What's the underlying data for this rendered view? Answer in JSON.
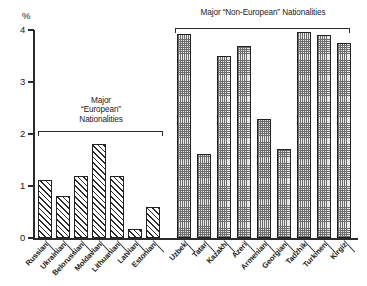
{
  "chart_data": {
    "type": "bar",
    "title": "",
    "xlabel": "",
    "ylabel": "%",
    "ylim": [
      0,
      4
    ],
    "ytick_labels": [
      "4",
      "3",
      "2",
      "1",
      "0"
    ],
    "ytick_values": [
      4,
      3,
      2,
      1,
      0
    ],
    "grid": false,
    "legend": null,
    "categories": [
      "Russian",
      "Ukrainian",
      "Belorussian",
      "Moldavian",
      "Lithuanian",
      "Latvian",
      "Estonian",
      "Uzbek",
      "Tatar",
      "Kazakh",
      "Azeri",
      "Armenian",
      "Georgian",
      "Tadzhik",
      "Turkmen",
      "Kirgiz"
    ],
    "values": [
      1.12,
      0.8,
      1.19,
      1.8,
      1.19,
      0.18,
      0.6,
      3.92,
      1.62,
      3.5,
      3.7,
      2.28,
      1.71,
      3.97,
      3.9,
      3.75
    ],
    "groups": [
      {
        "id": "european",
        "label_lines": [
          "Major",
          "“European”",
          "Nationalities"
        ],
        "pattern": "diagonal-hatch",
        "categories": [
          "Russian",
          "Ukrainian",
          "Belorussian",
          "Moldavian",
          "Lithuanian",
          "Latvian",
          "Estonian"
        ]
      },
      {
        "id": "non-european",
        "label_lines": [
          "Major “Non-European” Nationalities"
        ],
        "pattern": "checkered-dots",
        "categories": [
          "Uzbek",
          "Tatar",
          "Kazakh",
          "Azeri",
          "Armenian",
          "Georgian",
          "Tadzhik",
          "Turkmen",
          "Kirgiz"
        ]
      }
    ]
  },
  "axis": {
    "unit_label": "%",
    "ticks": [
      "4",
      "3",
      "2",
      "1",
      "0"
    ]
  },
  "annotations": {
    "european_line1": "Major",
    "european_line2": "“European”",
    "european_line3": "Nationalities",
    "non_european": "Major “Non-European” Nationalities"
  },
  "colors": {
    "axis": "#2b2b2b",
    "bar_outline": "#222222",
    "hatch": "#2b2b2b",
    "dot_fill": "#e8e8e8",
    "background": "#ffffff"
  }
}
